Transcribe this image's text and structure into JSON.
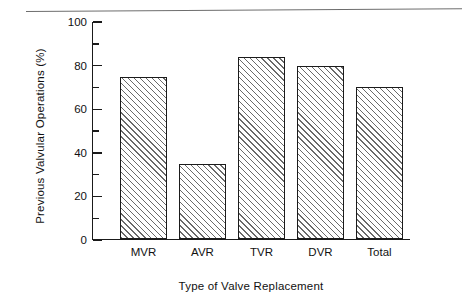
{
  "chart_data": {
    "type": "bar",
    "title": "",
    "subtitle": "",
    "xlabel": "Type of Valve Replacement",
    "ylabel": "Previous Valvular Operations (%)",
    "categories": [
      "MVR",
      "AVR",
      "TVR",
      "DVR",
      "Total"
    ],
    "values": [
      75,
      35,
      84,
      80,
      70
    ],
    "series": [
      {
        "name": "Previous Valvular Operations",
        "values": [
          75,
          35,
          84,
          80,
          70
        ]
      }
    ],
    "ylim": [
      0,
      100
    ],
    "ytick_labels": [
      "0",
      "20",
      "40",
      "60",
      "80",
      "100"
    ],
    "ytick_values": [
      0,
      20,
      40,
      60,
      80,
      100
    ],
    "yminor_tick_values": [
      10,
      30,
      50,
      70,
      90
    ],
    "grid": false,
    "legend": null,
    "legend_position": "none",
    "annotations": [],
    "bar_fill": "diagonal-hatch",
    "colors": {
      "axis": "#1a1a1a",
      "bar_outline": "#1b1b1b",
      "bar_hatch": "#6a6a6a",
      "background": "#ffffff",
      "rule": "#6d6d6d"
    }
  },
  "figure": {
    "top_rule_name": "horizontal-rule"
  }
}
